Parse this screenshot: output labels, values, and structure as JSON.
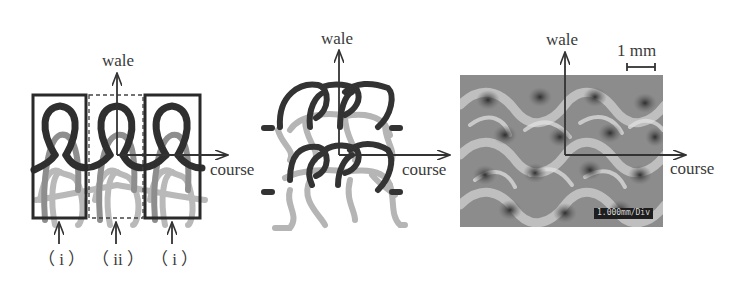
{
  "figure": {
    "panels": [
      {
        "id": "schematic-loops",
        "axis_labels": {
          "wale": "wale",
          "course": "course"
        },
        "region_labels": [
          "（ i ）",
          "（ ii ）",
          "（ i ）"
        ]
      },
      {
        "id": "knit-structure",
        "axis_labels": {
          "wale": "wale",
          "course": "course"
        }
      },
      {
        "id": "micrograph",
        "axis_labels": {
          "wale": "wale",
          "course": "course"
        },
        "scale_bar": {
          "label": "1 mm"
        },
        "image_caption": "1.000mm/Div"
      }
    ],
    "colors": {
      "dark_yarn": "#2f2f2f",
      "mid_yarn": "#8f8f8f",
      "light_yarn": "#b8b8b8",
      "axis": "#333333"
    }
  }
}
